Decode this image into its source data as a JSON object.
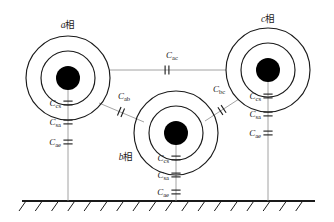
{
  "figure": {
    "background_color": "#ffffff",
    "line_color": "#1a1a1a",
    "connector_color": "#8c8c8c",
    "width": 334,
    "height": 222
  },
  "phases": [
    {
      "id": "a",
      "label_latin": "a",
      "label_cjk": "相",
      "label_x": 68,
      "label_y": 28,
      "center_x": 68,
      "center_y": 78,
      "outer_radius": 42,
      "middle_radius": 27,
      "core_radius": 12,
      "capacitors": [
        {
          "name": "Ccs",
          "sym": "C",
          "sub": "cs",
          "y": 103
        },
        {
          "name": "Csa",
          "sym": "C",
          "sub": "sa",
          "y": 122
        },
        {
          "name": "Cae",
          "sym": "C",
          "sub": "ae",
          "y": 142
        }
      ],
      "ground_y": 201
    },
    {
      "id": "b",
      "label_latin": "b",
      "label_cjk": "相",
      "label_x": 126,
      "label_y": 160,
      "center_x": 176,
      "center_y": 133,
      "outer_radius": 42,
      "middle_radius": 27,
      "core_radius": 12,
      "capacitors": [
        {
          "name": "Ccs",
          "sym": "C",
          "sub": "cs",
          "y": 158
        },
        {
          "name": "Csa",
          "sym": "C",
          "sub": "sa",
          "y": 175
        },
        {
          "name": "Cae",
          "sym": "C",
          "sub": "ae",
          "y": 192
        }
      ],
      "ground_y": 201
    },
    {
      "id": "c",
      "label_latin": "c",
      "label_cjk": "相",
      "label_x": 268,
      "label_y": 22,
      "center_x": 268,
      "center_y": 70,
      "outer_radius": 42,
      "middle_radius": 27,
      "core_radius": 12,
      "capacitors": [
        {
          "name": "Ccs",
          "sym": "C",
          "sub": "cs",
          "y": 96
        },
        {
          "name": "Csa",
          "sym": "C",
          "sub": "sa",
          "y": 114
        },
        {
          "name": "Cae",
          "sym": "C",
          "sub": "ae",
          "y": 133
        }
      ],
      "ground_y": 201
    }
  ],
  "couplings": [
    {
      "id": "ac",
      "sym": "C",
      "sub": "ac",
      "label_x": 172,
      "label_y": 58,
      "x1": 110,
      "y1": 70,
      "x2": 226,
      "y2": 70,
      "cap_x": 167,
      "cap_y": 70,
      "angle": 0
    },
    {
      "id": "ab",
      "sym": "C",
      "sub": "ab",
      "label_x": 124,
      "label_y": 99,
      "x1": 99,
      "y1": 103,
      "x2": 144,
      "y2": 122,
      "cap_x": 121,
      "cap_y": 112,
      "angle": 23
    },
    {
      "id": "bc",
      "sym": "C",
      "sub": "bc",
      "label_x": 219,
      "label_y": 92,
      "x1": 239,
      "y1": 99,
      "x2": 205,
      "y2": 121,
      "cap_x": 222,
      "cap_y": 110,
      "angle": -33
    }
  ],
  "ground": {
    "name": "earth-ground",
    "y": 201,
    "x_start": 22,
    "x_end": 315,
    "hatch_count": 18,
    "hatch_length": 12,
    "hatch_angle_dx": 7,
    "hatch_dy": 10
  }
}
